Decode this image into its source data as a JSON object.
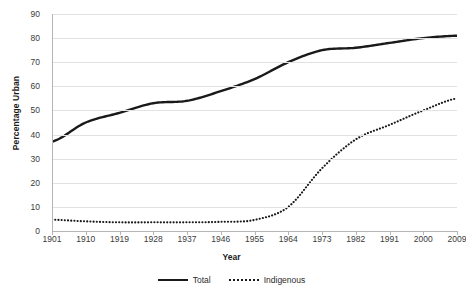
{
  "chart_data": {
    "type": "line",
    "title": "",
    "xlabel": "Year",
    "ylabel": "Percentage Urban",
    "xlim": [
      1901,
      2009
    ],
    "ylim": [
      0,
      90
    ],
    "ytick_step": 10,
    "grid": true,
    "legend_position": "bottom",
    "categories": [
      1901,
      1910,
      1919,
      1928,
      1937,
      1946,
      1955,
      1964,
      1973,
      1982,
      1991,
      2000,
      2009
    ],
    "xtick_labels": [
      "1901",
      "1910",
      "1919",
      "1928",
      "1937",
      "1946",
      "1955",
      "1964",
      "1973",
      "1982",
      "1991",
      "2000",
      "2009"
    ],
    "ytick_labels": [
      "0",
      "10",
      "20",
      "30",
      "40",
      "50",
      "60",
      "70",
      "80",
      "90"
    ],
    "series": [
      {
        "name": "Total",
        "style": "solid",
        "color": "#1a1a1a",
        "values": [
          37,
          45,
          49,
          53,
          54,
          58,
          63,
          70,
          75,
          76,
          78,
          80,
          81
        ]
      },
      {
        "name": "Indigenous",
        "style": "dotted",
        "color": "#1a1a1a",
        "values": [
          4.7,
          4,
          3.6,
          3.6,
          3.6,
          3.8,
          4.6,
          10,
          26,
          38,
          44,
          50,
          55
        ]
      }
    ]
  },
  "legend": {
    "items": [
      {
        "label": "Total",
        "swatch": "solid-line-swatch"
      },
      {
        "label": "Indigenous",
        "swatch": "dotted-line-swatch"
      }
    ]
  },
  "axes": {
    "y_title": "Percentage Urban",
    "x_title": "Year"
  }
}
